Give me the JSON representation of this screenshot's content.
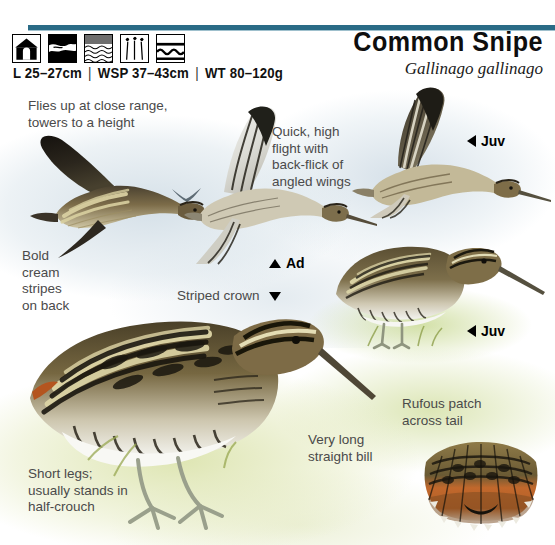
{
  "header": {
    "common_name": "Common Snipe",
    "scientific_name": "Gallinago gallinago",
    "rule_color": "#2a6b86",
    "measurements": {
      "length": "L 25–27cm",
      "wingspan": "WSP 37–43cm",
      "weight": "WT 80–120g",
      "separator": "|"
    },
    "habitat_icons": [
      {
        "name": "house-habitat-icon",
        "title": "gardens / buildings"
      },
      {
        "name": "marsh-habitat-icon",
        "title": "marsh / wet meadow"
      },
      {
        "name": "shallow-water-habitat-icon",
        "title": "shallow water"
      },
      {
        "name": "reeds-habitat-icon",
        "title": "reeds / rushes"
      },
      {
        "name": "open-water-habitat-icon",
        "title": "open water"
      }
    ]
  },
  "annotations": [
    {
      "id": "flies-up",
      "text": "Flies up at close range,\ntowers to a height",
      "x": 28,
      "y": 98
    },
    {
      "id": "quick-high-flight",
      "text": "Quick, high\nflight with\nback-flick of\nangled wings",
      "x": 272,
      "y": 124
    },
    {
      "id": "bold-cream-stripes",
      "text": "Bold\ncream\nstripes\non back",
      "x": 22,
      "y": 248
    },
    {
      "id": "striped-crown",
      "text": "Striped crown",
      "x": 177,
      "y": 288
    },
    {
      "id": "very-long-bill",
      "text": "Very long\nstraight bill",
      "x": 308,
      "y": 432
    },
    {
      "id": "rufous-patch",
      "text": "Rufous patch\nacross tail",
      "x": 402,
      "y": 396
    },
    {
      "id": "short-legs",
      "text": "Short legs;\nusually stands in\nhalf-crouch",
      "x": 28,
      "y": 466
    }
  ],
  "age_labels": [
    {
      "id": "juv-upper",
      "text": "Juv",
      "arrow": "left",
      "x": 467,
      "y": 133
    },
    {
      "id": "ad-center",
      "text": "Ad",
      "arrow": "up",
      "x": 269,
      "y": 255
    },
    {
      "id": "juv-lower",
      "text": "Juv",
      "arrow": "left",
      "x": 467,
      "y": 323
    }
  ],
  "plates": [
    {
      "id": "flying-snipe-upperwing-left",
      "label": "adult in flight, upperwing"
    },
    {
      "id": "flying-snipe-underwing-center",
      "label": "adult in flight, underwing"
    },
    {
      "id": "distant-snipe-silhouette",
      "label": "distant flying snipe"
    },
    {
      "id": "flying-snipe-juvenile-right",
      "label": "juvenile in flight"
    },
    {
      "id": "standing-snipe-juvenile",
      "label": "juvenile standing"
    },
    {
      "id": "standing-snipe-adult-large",
      "label": "adult standing, half-crouch"
    },
    {
      "id": "spread-tail-fan",
      "label": "spread tail showing rufous patch"
    }
  ],
  "colors": {
    "rule": "#2a6b86",
    "annotation_text": "#4a4a4a",
    "label_text": "#000000",
    "plumage_dark": "#2e2a20",
    "plumage_mid": "#6b5a3c",
    "plumage_cream": "#d9cf9e",
    "belly_white": "#f2f2ee",
    "leg_grey": "#9aa08c",
    "rufous": "#c1682c",
    "sky_wash": "#cedbe4",
    "grass_wash": "#d6df9e"
  }
}
